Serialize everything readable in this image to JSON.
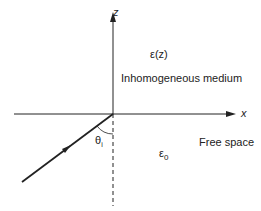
{
  "diagram": {
    "axes": {
      "z_label": "z",
      "x_label": "x"
    },
    "upper_region": {
      "permittivity": "ε(z)",
      "name": "Inhomogeneous medium"
    },
    "lower_region": {
      "permittivity_symbol": "ε",
      "permittivity_subscript": "0",
      "name": "Free space"
    },
    "angle": {
      "symbol": "θ",
      "subscript": "i"
    },
    "colors": {
      "line": "#222222",
      "background": "#ffffff"
    }
  }
}
